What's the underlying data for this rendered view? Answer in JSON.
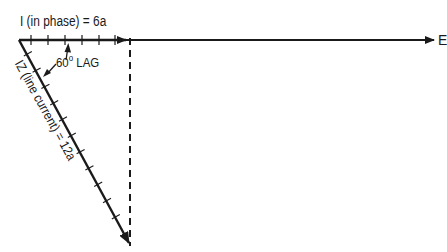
{
  "diagram": {
    "title_label": "I (in phase) = 6a",
    "axis_label": "E",
    "angle_label": {
      "value": "60",
      "degree": "o",
      "text": "LAG"
    },
    "line_current_label": "IZ (line current) = 12a",
    "colors": {
      "ink": "#1a1a1a",
      "background": "#ffffff"
    },
    "vectors": [
      {
        "name": "E",
        "direction": "horizontal reference",
        "from": [
          19,
          40
        ],
        "to": [
          436,
          40
        ]
      },
      {
        "name": "I in phase",
        "magnitude": "6a",
        "from": [
          19,
          40
        ],
        "to": [
          128,
          40
        ],
        "ticks": 6
      },
      {
        "name": "IZ line current",
        "magnitude": "12a",
        "angle_deg": -60,
        "from": [
          19,
          40
        ],
        "to": [
          130,
          244
        ],
        "ticks": 12
      },
      {
        "name": "projection",
        "style": "dashed",
        "from": [
          130,
          40
        ],
        "to": [
          130,
          244
        ]
      }
    ]
  }
}
